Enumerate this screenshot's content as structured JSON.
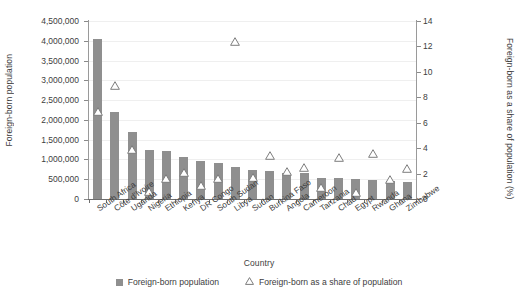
{
  "chart_data": {
    "type": "bar",
    "title": "",
    "xlabel": "Country",
    "ylabel": "Foreign-born population",
    "y2label": "Foreign-born as a share of population (%)",
    "grid": true,
    "legend_position": "bottom",
    "ylim": [
      0,
      4500000
    ],
    "y2lim": [
      0,
      14
    ],
    "yticks": [
      "0",
      "500,000",
      "1,000,000",
      "1,500,000",
      "2,000,000",
      "2,500,000",
      "3,000,000",
      "3,500,000",
      "4,000,000",
      "4,500,000"
    ],
    "y2ticks": [
      "0",
      "2",
      "4",
      "6",
      "8",
      "10",
      "12",
      "14"
    ],
    "categories": [
      "South Africa",
      "Côte d'Ivoire",
      "Uganda",
      "Nigeria",
      "Ethiopia",
      "Kenya",
      "DR Congo",
      "South Sudan",
      "Libya",
      "Sudan",
      "Burkina Faso",
      "Angola",
      "Cameroon",
      "Tanzania",
      "Chad",
      "Egypt",
      "Rwanda",
      "Ghana",
      "Zimbabwe"
    ],
    "series": [
      {
        "name": "Foreign-born population",
        "axis": "left",
        "type": "bar",
        "color": "#8f8f8f",
        "values": [
          4050000,
          2200000,
          1700000,
          1230000,
          1210000,
          1060000,
          960000,
          900000,
          820000,
          730000,
          700000,
          660000,
          650000,
          530000,
          540000,
          500000,
          480000,
          450000,
          420000
        ]
      },
      {
        "name": "Foreign-born as a share of population",
        "axis": "right",
        "type": "scatter",
        "marker": "triangle-open",
        "color": "#7d7d7d",
        "values": [
          6.9,
          8.9,
          3.9,
          0.6,
          1.6,
          2.1,
          1.1,
          1.6,
          12.4,
          1.7,
          3.4,
          2.2,
          2.5,
          0.9,
          3.3,
          0.5,
          3.6,
          1.5,
          2.4
        ]
      }
    ],
    "legend": [
      "Foreign-born population",
      "Foreign-born as a share of population"
    ]
  }
}
